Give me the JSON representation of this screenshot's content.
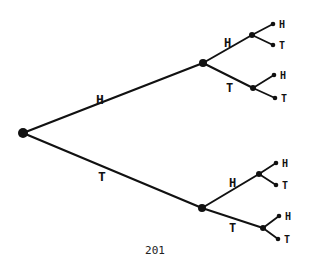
{
  "diagram": {
    "type": "probability-tree",
    "ink_color": "#111111",
    "background": "#ffffff",
    "root": {
      "x": 23,
      "y": 133
    },
    "level1": [
      {
        "label": "H",
        "x": 203,
        "y": 63,
        "label_x": 96,
        "label_y": 104
      },
      {
        "label": "T",
        "x": 202,
        "y": 208,
        "label_x": 98,
        "label_y": 181
      }
    ],
    "level2": [
      {
        "parent": 0,
        "label": "H",
        "x": 252,
        "y": 35,
        "label_x": 224,
        "label_y": 47
      },
      {
        "parent": 0,
        "label": "T",
        "x": 253,
        "y": 88,
        "label_x": 226,
        "label_y": 92
      },
      {
        "parent": 1,
        "label": "H",
        "x": 259,
        "y": 174,
        "label_x": 229,
        "label_y": 187
      },
      {
        "parent": 1,
        "label": "T",
        "x": 263,
        "y": 228,
        "label_x": 229,
        "label_y": 232
      }
    ],
    "leaves": [
      {
        "parent": 0,
        "label": "H",
        "x": 273,
        "y": 24
      },
      {
        "parent": 0,
        "label": "T",
        "x": 273,
        "y": 45
      },
      {
        "parent": 1,
        "label": "H",
        "x": 274,
        "y": 75
      },
      {
        "parent": 1,
        "label": "T",
        "x": 275,
        "y": 98
      },
      {
        "parent": 2,
        "label": "H",
        "x": 276,
        "y": 163
      },
      {
        "parent": 2,
        "label": "T",
        "x": 276,
        "y": 185
      },
      {
        "parent": 3,
        "label": "H",
        "x": 279,
        "y": 216
      },
      {
        "parent": 3,
        "label": "T",
        "x": 278,
        "y": 239
      }
    ],
    "page_number": "201"
  }
}
